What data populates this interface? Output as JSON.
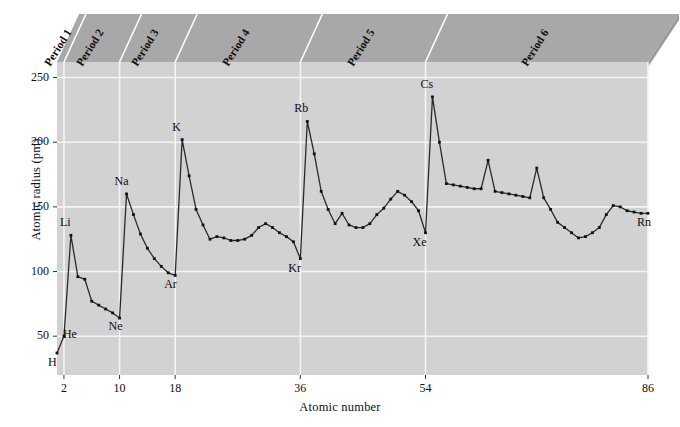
{
  "chart_data": {
    "type": "line",
    "title": "",
    "xlabel": "Atomic number",
    "ylabel": "Atomic radius (pm)",
    "xlim": [
      1,
      86
    ],
    "ylim": [
      20,
      262
    ],
    "xticks": [
      2,
      10,
      18,
      36,
      54,
      86
    ],
    "yticks": [
      50,
      100,
      150,
      200,
      250
    ],
    "grid": "both",
    "legend": "none",
    "plot_bg": "#d2d2d2",
    "line_color": "#2a2a2a",
    "marker_color": "#111111",
    "band_color": "#a8a8a8",
    "gridline_color": "#f4f4f4",
    "annotations": [
      {
        "label": "H",
        "x": 1,
        "y": 37,
        "dx": -2,
        "dy": 16
      },
      {
        "label": "He",
        "x": 2,
        "y": 50,
        "dx": 6,
        "dy": 5
      },
      {
        "label": "Li",
        "x": 3,
        "y": 128,
        "dx": -4,
        "dy": -6
      },
      {
        "label": "Ne",
        "x": 10,
        "y": 64,
        "dx": -4,
        "dy": 15
      },
      {
        "label": "Na",
        "x": 11,
        "y": 160,
        "dx": -5,
        "dy": -6
      },
      {
        "label": "Ar",
        "x": 18,
        "y": 97,
        "dx": -4,
        "dy": 16
      },
      {
        "label": "K",
        "x": 19,
        "y": 202,
        "dx": -3,
        "dy": -6
      },
      {
        "label": "Kr",
        "x": 36,
        "y": 110,
        "dx": -5,
        "dy": 16
      },
      {
        "label": "Rb",
        "x": 37,
        "y": 216,
        "dx": -6,
        "dy": -6
      },
      {
        "label": "Xe",
        "x": 54,
        "y": 130,
        "dx": -6,
        "dy": 16
      },
      {
        "label": "Cs",
        "x": 55,
        "y": 235,
        "dx": -5,
        "dy": -6
      },
      {
        "label": "Rn",
        "x": 86,
        "y": 145,
        "dx": -4,
        "dy": 16
      }
    ],
    "period_bands": [
      {
        "label": "Period 1",
        "start": 1,
        "end": 2
      },
      {
        "label": "Period 2",
        "start": 2,
        "end": 10
      },
      {
        "label": "Period 3",
        "start": 10,
        "end": 18
      },
      {
        "label": "Period 4",
        "start": 18,
        "end": 36
      },
      {
        "label": "Period 5",
        "start": 36,
        "end": 54
      },
      {
        "label": "Period 6",
        "start": 54,
        "end": 86
      }
    ],
    "x": [
      1,
      2,
      3,
      4,
      5,
      6,
      7,
      8,
      9,
      10,
      11,
      12,
      13,
      14,
      15,
      16,
      17,
      18,
      19,
      20,
      21,
      22,
      23,
      24,
      25,
      26,
      27,
      28,
      29,
      30,
      31,
      32,
      33,
      34,
      35,
      36,
      37,
      38,
      39,
      40,
      41,
      42,
      43,
      44,
      45,
      46,
      47,
      48,
      49,
      50,
      51,
      52,
      53,
      54,
      55,
      56,
      57,
      58,
      59,
      60,
      61,
      62,
      63,
      64,
      65,
      66,
      67,
      68,
      69,
      70,
      71,
      72,
      73,
      74,
      75,
      76,
      77,
      78,
      79,
      80,
      81,
      82,
      83,
      84,
      85,
      86
    ],
    "y": [
      37,
      50,
      128,
      96,
      94,
      77,
      74,
      71,
      68,
      64,
      160,
      144,
      129,
      118,
      110,
      104,
      99,
      97,
      202,
      174,
      148,
      136,
      125,
      127,
      126,
      124,
      124,
      125,
      128,
      134,
      137,
      134,
      130,
      127,
      123,
      110,
      216,
      191,
      162,
      148,
      137,
      145,
      136,
      134,
      134,
      137,
      144,
      149,
      156,
      162,
      159,
      154,
      147,
      130,
      235,
      200,
      168,
      167,
      166,
      165,
      164,
      164,
      186,
      162,
      161,
      160,
      159,
      158,
      157,
      180,
      157,
      148,
      138,
      134,
      130,
      126,
      127,
      130,
      134,
      144,
      151,
      150,
      147,
      146,
      145,
      145
    ],
    "series_name": "Atomic radius"
  }
}
